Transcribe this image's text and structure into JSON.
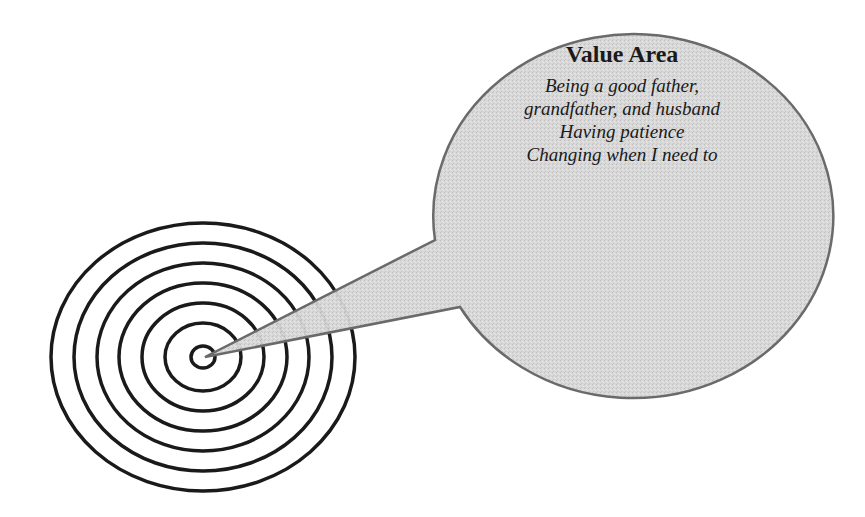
{
  "diagram": {
    "target": {
      "center": [
        203,
        357
      ],
      "rings": 7,
      "stroke_color": "#1a1a1a"
    },
    "callout": {
      "fill_color": "#d4d4d4",
      "stroke_color": "#6a6a6a",
      "title": "Value Area",
      "lines": [
        "Being a good father,",
        "grandfather, and husband",
        "Having patience",
        "Changing when I need to"
      ]
    }
  }
}
